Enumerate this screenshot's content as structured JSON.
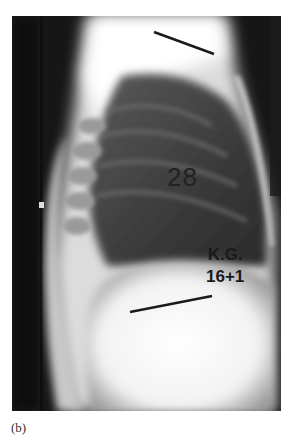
{
  "figure": {
    "caption": "(b)",
    "image_description": "Lateral chest X-ray radiograph",
    "annotations": {
      "number_label": "28",
      "initials_label": "K.G.",
      "age_label": "16+1"
    }
  }
}
